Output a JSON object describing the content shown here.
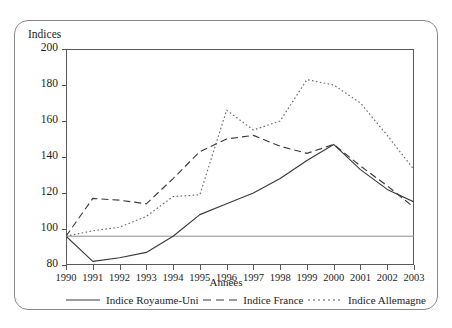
{
  "figure": {
    "y_axis_title": "Indices",
    "x_axis_title": "Années"
  },
  "chart_data": {
    "type": "line",
    "title": "",
    "subtitle": "",
    "xlabel": "Années",
    "ylabel": "Indices",
    "x": [
      1990,
      1991,
      1992,
      1993,
      1994,
      1995,
      1996,
      1997,
      1998,
      1999,
      2000,
      2001,
      2002,
      2003
    ],
    "xtick_labels": [
      "1990",
      "1991",
      "1992",
      "1993",
      "1994",
      "1995",
      "1996",
      "1997",
      "1998",
      "1999",
      "2000",
      "2001",
      "2002",
      "2003"
    ],
    "ytick_labels": [
      "80",
      "100",
      "120",
      "140",
      "160",
      "180",
      "200"
    ],
    "yticks": [
      80,
      100,
      120,
      140,
      160,
      180,
      200
    ],
    "ylim": [
      80,
      200
    ],
    "xlim": [
      1990,
      2003
    ],
    "grid": false,
    "reference_line": 96,
    "legend_position": "bottom",
    "series": [
      {
        "name": "Indice Royaume-Uni",
        "style": "solid",
        "color": "#3a3a3a",
        "values": [
          96,
          82,
          84,
          87,
          96,
          108,
          114,
          120,
          128,
          138,
          147,
          133,
          122,
          115
        ]
      },
      {
        "name": "Indice France",
        "style": "dashed",
        "color": "#3a3a3a",
        "values": [
          96,
          117,
          116,
          114,
          128,
          143,
          150,
          152,
          146,
          142,
          147,
          135,
          124,
          112
        ]
      },
      {
        "name": "Indice Allemagne",
        "style": "dotted",
        "color": "#6a6a6a",
        "values": [
          96,
          99,
          101,
          107,
          118,
          119,
          166,
          155,
          160,
          183,
          180,
          170,
          152,
          133
        ]
      }
    ]
  },
  "legend": {
    "items": [
      {
        "label": "Indice Royaume-Uni"
      },
      {
        "label": "Indice France"
      },
      {
        "label": "Indice Allemagne"
      }
    ]
  }
}
